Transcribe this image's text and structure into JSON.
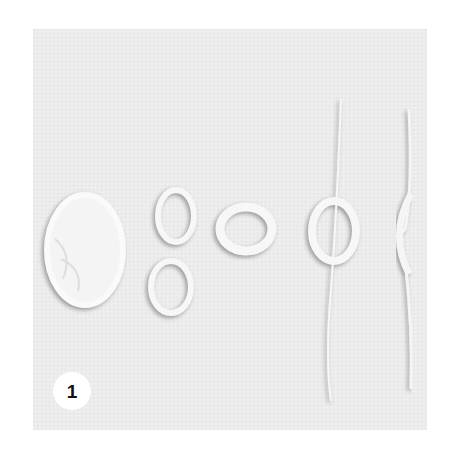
{
  "figure": {
    "badge_number": "1",
    "background_color": "#ececec",
    "shapes": [
      "filled-oval",
      "figure-eight",
      "small-ring",
      "ring-on-strand",
      "pinched-strand"
    ]
  }
}
